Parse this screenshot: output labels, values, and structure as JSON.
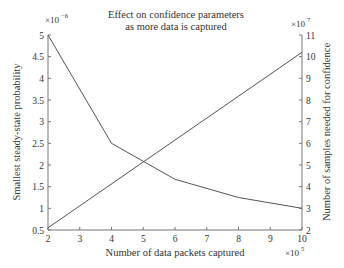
{
  "chart_data": {
    "type": "line",
    "title": "Effect on confidence parameters as more data is captured",
    "title_lines": [
      "Effect on confidence parameters",
      "as more data is captured"
    ],
    "xlabel": "Number of data packets captured",
    "x_multiplier": "×10^5",
    "x": [
      2,
      4,
      6,
      8,
      10
    ],
    "xlim": [
      2,
      10
    ],
    "xticks": [
      2,
      3,
      4,
      5,
      6,
      7,
      8,
      9,
      10
    ],
    "ylabel_left": "Smallest steady-state probability",
    "y_left_multiplier": "×10^-6",
    "ylim_left": [
      0.5,
      5
    ],
    "yticks_left": [
      0.5,
      1,
      1.5,
      2,
      2.5,
      3,
      3.5,
      4,
      4.5,
      5
    ],
    "ylabel_right": "Number of samples needed for confidence",
    "y_right_multiplier": "×10^7",
    "ylim_right": [
      2,
      11
    ],
    "yticks_right": [
      2,
      3,
      4,
      5,
      6,
      7,
      8,
      9,
      10,
      11
    ],
    "grid": false,
    "legend": null,
    "series": [
      {
        "name": "Smallest steady-state probability",
        "axis": "left",
        "x": [
          2,
          4,
          6,
          8,
          10
        ],
        "values": [
          5.0,
          2.5,
          1.67,
          1.25,
          1.0
        ],
        "color": "#555555"
      },
      {
        "name": "Number of samples needed for confidence",
        "axis": "right",
        "x": [
          2,
          10
        ],
        "values": [
          2.1,
          10.2
        ],
        "color": "#555555"
      }
    ]
  },
  "labels": {
    "title1": "Effect on confidence parameters",
    "title2": "as more data is captured",
    "xlabel": "Number of data packets captured",
    "ylabel_left": "Smallest steady-state probability",
    "ylabel_right": "Number of samples needed for confidence",
    "xmult_base": "×10",
    "xmult_exp": "5",
    "ylmult_base": "×10",
    "ylmult_exp": "−6",
    "yrmult_base": "×10",
    "yrmult_exp": "7"
  }
}
